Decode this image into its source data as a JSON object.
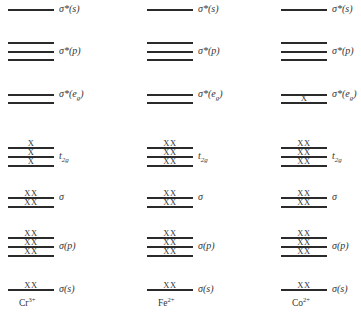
{
  "diagram": {
    "type": "molecular-orbital-energy-levels",
    "level_labels": {
      "sigma_star_s": "σ*(s)",
      "sigma_star_p": "σ*(p)",
      "sigma_star_eg": "σ*(e",
      "sigma_star_eg_sub": "g",
      "sigma_star_eg_close": ")",
      "t2g": "t",
      "t2g_sub": "2g",
      "sigma": "σ",
      "sigma_p": "σ(p)",
      "sigma_s": "σ(s)"
    },
    "columns": [
      {
        "ion": "Cr",
        "charge": "3+",
        "occupancy": {
          "sigma_star_s": [
            ""
          ],
          "sigma_star_p": [
            "",
            "",
            ""
          ],
          "sigma_star_eg": [
            "",
            ""
          ],
          "t2g": [
            "X",
            "X",
            "X"
          ],
          "sigma": [
            "XX",
            "XX"
          ],
          "sigma_p": [
            "XX",
            "XX",
            "XX"
          ],
          "sigma_s": [
            "XX"
          ]
        }
      },
      {
        "ion": "Fe",
        "charge": "2+",
        "occupancy": {
          "sigma_star_s": [
            ""
          ],
          "sigma_star_p": [
            "",
            "",
            ""
          ],
          "sigma_star_eg": [
            "",
            ""
          ],
          "t2g": [
            "XX",
            "XX",
            "XX"
          ],
          "sigma": [
            "XX",
            "XX"
          ],
          "sigma_p": [
            "XX",
            "XX",
            "XX"
          ],
          "sigma_s": [
            "XX"
          ]
        }
      },
      {
        "ion": "Co",
        "charge": "2+",
        "occupancy": {
          "sigma_star_s": [
            ""
          ],
          "sigma_star_p": [
            "",
            "",
            ""
          ],
          "sigma_star_eg": [
            "",
            "X"
          ],
          "t2g": [
            "XX",
            "XX",
            "XX"
          ],
          "sigma": [
            "XX",
            "XX"
          ],
          "sigma_p": [
            "XX",
            "XX",
            "XX"
          ],
          "sigma_s": [
            "XX"
          ]
        }
      }
    ]
  }
}
